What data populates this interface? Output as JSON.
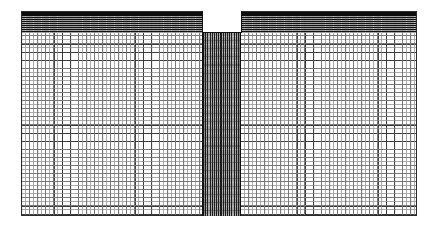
{
  "figure": {
    "title": "Finite element mesh of a notched rectangular plate",
    "type": "fem-mesh-diagram",
    "background_color": "#ffffff"
  },
  "domain": {
    "label": "mesh-domain",
    "x": 21,
    "y": 11,
    "width": 396,
    "height": 205,
    "outline_color": "#2b2b2b"
  },
  "regions": [
    {
      "name": "top-refined-band",
      "description": "Graded highly-refined horizontal band of elements along the top edge",
      "x": 0,
      "y": 0,
      "width": 396,
      "height": 22,
      "fill_color": "#2a2a2a",
      "line_color": "#111111",
      "refinement": "graded-vertical"
    },
    {
      "name": "notch-void",
      "description": "Rectangular white void / notch opening at the top centre of the plate",
      "x": 182,
      "y": 0,
      "width": 38,
      "height": 21,
      "fill_color": "#ffffff",
      "line_color": "#111111"
    },
    {
      "name": "refined-column",
      "description": "Vertical strip of strongly refined elements running from the notch root to the bottom edge",
      "x": 182,
      "y": 21,
      "width": 38,
      "height": 184,
      "fill_color": "#5e5e5e",
      "line_color": "#1c1c1c",
      "refinement": "graded-horizontal"
    },
    {
      "name": "coarse-field",
      "description": "Regular structured quadrilateral grid filling the remainder of the plate",
      "fill_color": "#ffffff",
      "line_color": "#3a3a3a",
      "cell_width": 8,
      "cell_height": 8
    }
  ],
  "mesh": {
    "element_type": "quadrilateral",
    "coarse_cell_size_px": 8,
    "coarse_columns_left": 23,
    "coarse_columns_right": 22,
    "coarse_rows": 23,
    "line_color": "#3a3a3a",
    "sub_line_color": "#8d8d8d"
  },
  "colors": {
    "background": "#ffffff",
    "mesh_line": "#3a3a3a",
    "dense_band": "#111111",
    "refined_column": "#5e5e5e",
    "void": "#ffffff",
    "outline": "#2b2b2b"
  }
}
